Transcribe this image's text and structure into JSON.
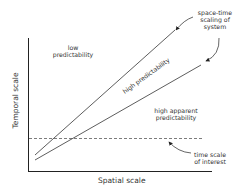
{
  "diagram": {
    "axes": {
      "x_label": "Spatial scale",
      "y_label": "Temporal scale"
    },
    "regions": {
      "low": [
        "low",
        "predictability"
      ],
      "high": "high predictability",
      "apparent": [
        "high apparent",
        "predictability"
      ]
    },
    "annotations": {
      "system": [
        "space-time",
        "scaling of",
        "system"
      ],
      "interest": [
        "time scale",
        "of interest"
      ]
    },
    "colors": {
      "line": "#333333",
      "background": "#ffffff"
    }
  }
}
